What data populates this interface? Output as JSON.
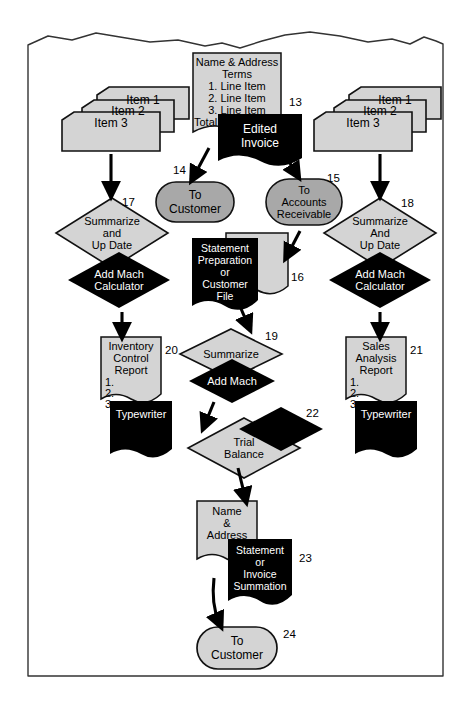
{
  "page": {
    "torn_top_edge": true,
    "colors": {
      "light_gray": "#d4d4d4",
      "mid_gray": "#a8a8a8",
      "black": "#000000",
      "outline": "#1a1a1a",
      "paper": "#ffffff"
    }
  },
  "nodes": {
    "invoice_doc": {
      "id": "13",
      "lines": [
        "Name & Address",
        "Terms",
        "1. Line Item",
        "2. Line Item",
        "3. Line Item",
        "Total"
      ],
      "fill": "light_gray"
    },
    "edited_invoice": {
      "lines": [
        "Edited",
        "Invoice"
      ],
      "fill": "black"
    },
    "left_items": {
      "lines": [
        "Item 1",
        "Item 2",
        "Item 3"
      ],
      "fill": "light_gray"
    },
    "right_items": {
      "lines": [
        "Item 1",
        "Item 2",
        "Item 3"
      ],
      "fill": "light_gray"
    },
    "to_customer_top": {
      "id": "14",
      "lines": [
        "To",
        "Customer"
      ],
      "fill": "mid_gray"
    },
    "to_accounts_receivable": {
      "id": "15",
      "lines": [
        "To",
        "Accounts",
        "Receivable"
      ],
      "fill": "mid_gray"
    },
    "left_summarize": {
      "id": "17",
      "lines": [
        "Summarize",
        "and",
        "Up Date"
      ],
      "fill": "light_gray"
    },
    "left_add_mach": {
      "lines": [
        "Add Mach",
        "Calculator"
      ],
      "fill": "black"
    },
    "right_summarize": {
      "id": "18",
      "lines": [
        "Summarize",
        "And",
        "Up Date"
      ],
      "fill": "light_gray"
    },
    "right_add_mach": {
      "lines": [
        "Add Mach",
        "Calculator"
      ],
      "fill": "black"
    },
    "customer_file_doc": {
      "id": "16",
      "lines": [],
      "fill": "light_gray"
    },
    "statement_preparation": {
      "lines": [
        "Statement",
        "Preparation",
        "or",
        "Customer",
        "File"
      ],
      "fill": "black"
    },
    "inventory_control_report": {
      "id": "20",
      "lines": [
        "Inventory",
        "Control",
        "Report"
      ],
      "numbered": [
        "1.",
        "2.",
        "3."
      ],
      "fill": "light_gray"
    },
    "left_typewriter": {
      "lines": [
        "Typewriter"
      ],
      "fill": "black"
    },
    "sales_analysis_report": {
      "id": "21",
      "lines": [
        "Sales",
        "Analysis",
        "Report"
      ],
      "numbered": [
        "1.",
        "2.",
        "3."
      ],
      "fill": "light_gray"
    },
    "right_typewriter": {
      "lines": [
        "Typewriter"
      ],
      "fill": "black"
    },
    "center_summarize": {
      "id": "19",
      "lines": [
        "Summarize"
      ],
      "fill": "light_gray"
    },
    "center_add_mach": {
      "lines": [
        "Add Mach"
      ],
      "fill": "black"
    },
    "trial_balance": {
      "id": "22",
      "lines": [
        "Trial",
        "Balance"
      ],
      "fill": "light_gray"
    },
    "trial_balance_shadow": {
      "lines": [],
      "fill": "black"
    },
    "name_address_doc": {
      "lines": [
        "Name",
        "&",
        "Address"
      ],
      "fill": "light_gray"
    },
    "statement_or_invoice_summation": {
      "id": "23",
      "lines": [
        "Statement",
        "or",
        "Invoice",
        "Summation"
      ],
      "fill": "black"
    },
    "to_customer_bottom": {
      "id": "24",
      "lines": [
        "To",
        "Customer"
      ],
      "fill": "light_gray"
    }
  },
  "callouts": [
    "13",
    "14",
    "15",
    "16",
    "17",
    "18",
    "19",
    "20",
    "21",
    "22",
    "23",
    "24"
  ]
}
